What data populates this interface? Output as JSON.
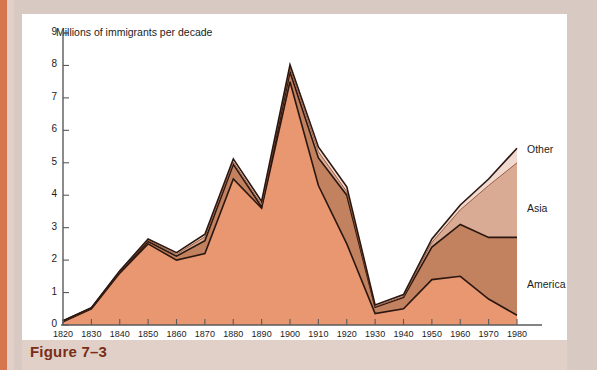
{
  "figure": {
    "caption": "Figure 7–3",
    "axis_title": "Millions of immigrants per decade"
  },
  "legend": [
    {
      "label": "Other",
      "color": "#f0d9cf"
    },
    {
      "label": "Asia",
      "color": "#d9ab95"
    },
    {
      "label": "America",
      "color": "#c2825f"
    },
    {
      "label": "Europe",
      "color": "#e99771"
    }
  ],
  "axis": {
    "y_ticks": [
      "0",
      "1",
      "2",
      "3",
      "4",
      "5",
      "6",
      "7",
      "8",
      "9"
    ],
    "y_min": 0,
    "y_max": 9
  },
  "chart_data": {
    "type": "area",
    "title": "",
    "subtitle": "",
    "xlabel": "",
    "ylabel": "Millions of immigrants per decade",
    "ylim": [
      0,
      9
    ],
    "grid": false,
    "legend_position": "right",
    "stacked": true,
    "categories": [
      "1820–29",
      "1830–39",
      "1840–49",
      "1850–59",
      "1860–69",
      "1870–79",
      "1880–89",
      "1890–99",
      "1900–09",
      "1910–19",
      "1920–29",
      "1930–39",
      "1940–49",
      "1950–59",
      "1960–69",
      "1970–79",
      "1980–84"
    ],
    "tick_labels_top": [
      "1820",
      "1830",
      "1840",
      "1850",
      "1860",
      "1870",
      "1880",
      "1890",
      "1900",
      "1910",
      "1920",
      "1930",
      "1940",
      "1950",
      "1960",
      "1970",
      "1980"
    ],
    "tick_labels_bottom": [
      "–29",
      "–39",
      "–49",
      "–59",
      "–69",
      "–79",
      "–89",
      "–99",
      "–09",
      "–19",
      "–29",
      "–39",
      "–49",
      "–59",
      "–69",
      "–79",
      "–84"
    ],
    "series": [
      {
        "name": "Europe",
        "color": "#e99771",
        "values": [
          0.1,
          0.5,
          1.6,
          2.5,
          2.0,
          2.2,
          4.5,
          3.6,
          7.5,
          4.3,
          2.5,
          0.35,
          0.5,
          1.4,
          1.5,
          0.8,
          0.3
        ]
      },
      {
        "name": "America",
        "color": "#c2825f",
        "values": [
          0.02,
          0.02,
          0.05,
          0.07,
          0.12,
          0.4,
          0.45,
          0.04,
          0.3,
          0.85,
          1.5,
          0.2,
          0.35,
          1.0,
          1.6,
          1.9,
          2.4
        ]
      },
      {
        "name": "Asia",
        "color": "#d9ab95",
        "values": [
          0.0,
          0.0,
          0.0,
          0.04,
          0.06,
          0.12,
          0.07,
          0.07,
          0.12,
          0.19,
          0.11,
          0.02,
          0.03,
          0.15,
          0.45,
          1.6,
          2.3
        ]
      },
      {
        "name": "Other",
        "color": "#f0d9cf",
        "values": [
          0.01,
          0.01,
          0.02,
          0.04,
          0.05,
          0.08,
          0.1,
          0.1,
          0.1,
          0.15,
          0.15,
          0.05,
          0.06,
          0.1,
          0.15,
          0.2,
          0.45
        ]
      }
    ],
    "totals": [
      0.13,
      0.53,
      1.67,
      2.65,
      2.23,
      2.8,
      5.12,
      3.81,
      8.02,
      5.49,
      4.26,
      0.62,
      0.94,
      2.65,
      3.7,
      4.5,
      5.45
    ]
  }
}
